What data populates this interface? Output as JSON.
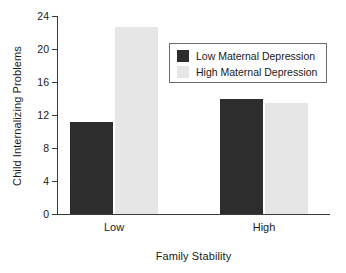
{
  "chart_data": {
    "type": "bar",
    "title": "",
    "subtitle": "",
    "xlabel": "Family Stability",
    "ylabel": "Child Internalizing Problems",
    "categories": [
      "Low",
      "High"
    ],
    "series": [
      {
        "name": "Low Maternal Depression",
        "color": "#2d2d2d",
        "values": [
          11.2,
          13.9
        ]
      },
      {
        "name": "High Maternal Depression",
        "color": "#e6e6e6",
        "values": [
          22.7,
          13.5
        ]
      }
    ],
    "ylim": [
      0,
      24
    ],
    "yticks": [
      0,
      4,
      8,
      12,
      16,
      20,
      24
    ],
    "ytick_labels": [
      "0",
      "4",
      "8",
      "12",
      "16",
      "20",
      "24"
    ],
    "xticks": [
      "Low",
      "High"
    ],
    "grid": false,
    "legend_position": "upper-right",
    "legend_border_color": "#6d6d6d",
    "axis_color": "#3a3a3a",
    "background": "#ffffff"
  },
  "axis": {
    "y_label": "Child Internalizing Problems",
    "x_label": "Family Stability",
    "y_ticks": [
      "24",
      "20",
      "16",
      "12",
      "8",
      "4",
      "0"
    ],
    "x_ticks": [
      "Low",
      "High"
    ]
  },
  "legend": {
    "items": [
      {
        "label": "Low Maternal Depression",
        "color": "#2d2d2d"
      },
      {
        "label": "High Maternal Depression",
        "color": "#e6e6e6"
      }
    ]
  }
}
